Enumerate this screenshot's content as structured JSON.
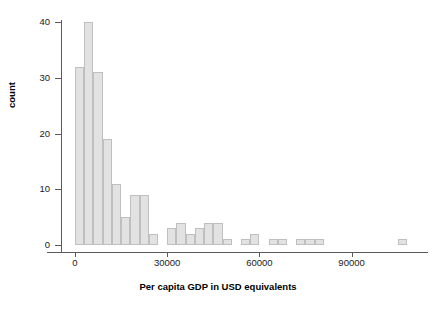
{
  "chart_data": {
    "type": "bar",
    "title": "",
    "subtitle": "",
    "xlabel": "Per capita GDP in USD equivalents",
    "ylabel": "count",
    "xlim": [
      -3000,
      117000
    ],
    "ylim": [
      0,
      42
    ],
    "xticks": [
      0,
      30000,
      60000,
      90000
    ],
    "xtick_labels": [
      "0",
      "30000",
      "60000",
      "90000"
    ],
    "yticks": [
      0,
      10,
      20,
      30,
      40
    ],
    "ytick_labels": [
      "0",
      "10",
      "20",
      "30",
      "40"
    ],
    "grid": false,
    "legend": null,
    "bin_width": 3000,
    "bar_color": "#e2e2e2",
    "bar_edge_color": "#bfbfbf",
    "bins": [
      {
        "x0": 0,
        "x1": 3000,
        "count": 32
      },
      {
        "x0": 3000,
        "x1": 6000,
        "count": 40
      },
      {
        "x0": 6000,
        "x1": 9000,
        "count": 31
      },
      {
        "x0": 9000,
        "x1": 12000,
        "count": 19
      },
      {
        "x0": 12000,
        "x1": 15000,
        "count": 11
      },
      {
        "x0": 15000,
        "x1": 18000,
        "count": 5
      },
      {
        "x0": 18000,
        "x1": 21000,
        "count": 9
      },
      {
        "x0": 21000,
        "x1": 24000,
        "count": 9
      },
      {
        "x0": 24000,
        "x1": 27000,
        "count": 2
      },
      {
        "x0": 27000,
        "x1": 30000,
        "count": 0
      },
      {
        "x0": 30000,
        "x1": 33000,
        "count": 3
      },
      {
        "x0": 33000,
        "x1": 36000,
        "count": 4
      },
      {
        "x0": 36000,
        "x1": 39000,
        "count": 2
      },
      {
        "x0": 39000,
        "x1": 42000,
        "count": 3
      },
      {
        "x0": 42000,
        "x1": 45000,
        "count": 4
      },
      {
        "x0": 45000,
        "x1": 48000,
        "count": 4
      },
      {
        "x0": 48000,
        "x1": 51000,
        "count": 1
      },
      {
        "x0": 51000,
        "x1": 54000,
        "count": 0
      },
      {
        "x0": 54000,
        "x1": 57000,
        "count": 1
      },
      {
        "x0": 57000,
        "x1": 60000,
        "count": 2
      },
      {
        "x0": 60000,
        "x1": 63000,
        "count": 0
      },
      {
        "x0": 63000,
        "x1": 66000,
        "count": 1
      },
      {
        "x0": 66000,
        "x1": 69000,
        "count": 1
      },
      {
        "x0": 69000,
        "x1": 72000,
        "count": 0
      },
      {
        "x0": 72000,
        "x1": 75000,
        "count": 1
      },
      {
        "x0": 75000,
        "x1": 78000,
        "count": 1
      },
      {
        "x0": 78000,
        "x1": 81000,
        "count": 1
      },
      {
        "x0": 81000,
        "x1": 84000,
        "count": 0
      },
      {
        "x0": 105000,
        "x1": 108000,
        "count": 1
      }
    ]
  },
  "geometry": {
    "x0_px": 75,
    "px_per_unit_x": 0.003073,
    "y0_px": 245,
    "px_per_unit_y": 5.575
  }
}
